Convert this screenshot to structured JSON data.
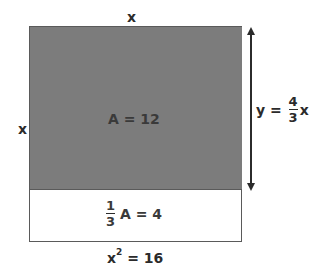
{
  "diagram": {
    "top_side_label": "x",
    "left_side_label": "x",
    "shaded_region": {
      "label": "A = 12",
      "color": "#7c7c7c"
    },
    "unshaded_region": {
      "fraction_numerator": "1",
      "fraction_denominator": "3",
      "label_rest": "A = 4"
    },
    "height_annotation": {
      "prefix": "y = ",
      "fraction_numerator": "4",
      "fraction_denominator": "3",
      "suffix": "x"
    },
    "bottom_label": {
      "base": "x",
      "exponent": "2",
      "rest": " = 16"
    }
  }
}
